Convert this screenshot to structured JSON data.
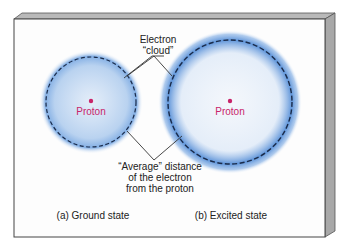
{
  "diagram": {
    "labels": {
      "electron_cloud_line1": "Electron",
      "electron_cloud_line2": "“cloud”",
      "avg_line1": "“Average” distance",
      "avg_line2": "of the electron",
      "avg_line3": "from the proton"
    },
    "ground_state": {
      "caption": "(a) Ground state",
      "nucleus_label": "Proton"
    },
    "excited_state": {
      "caption": "(b) Excited state",
      "nucleus_label": "Proton"
    },
    "colors": {
      "cloud": "#3a7fd5",
      "proton": "#c8246a",
      "frame_side": "#a8a8a8",
      "orbit": "#1a2b4a"
    }
  }
}
